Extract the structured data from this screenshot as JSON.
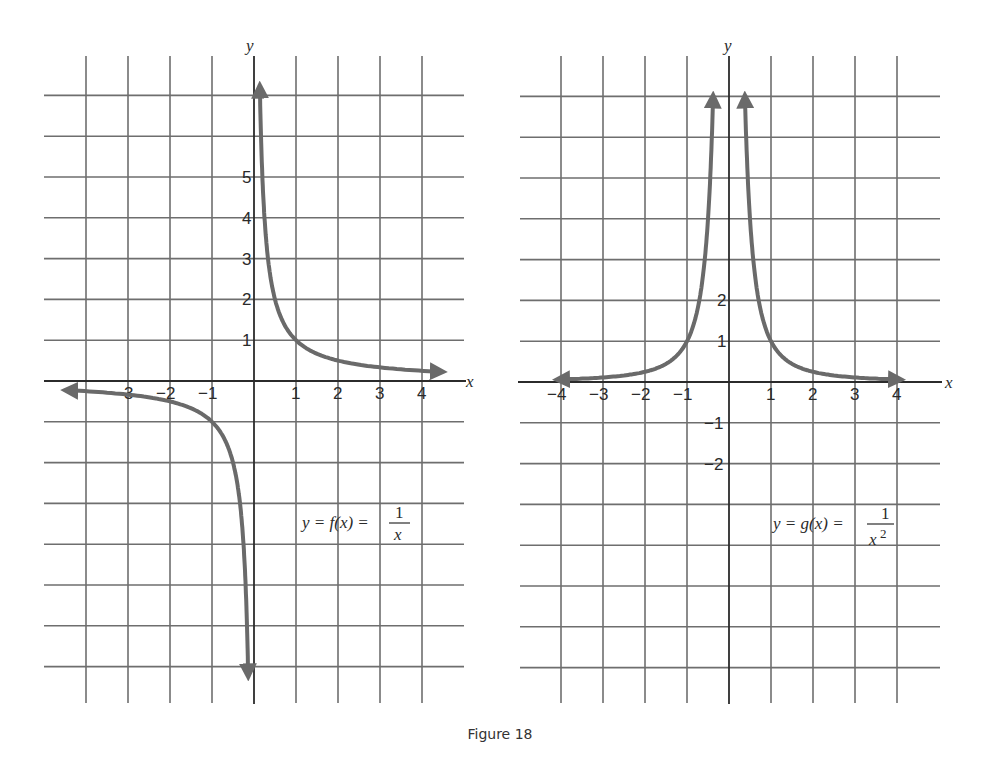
{
  "figure": {
    "caption": "Figure 18"
  },
  "panels": [
    {
      "id": "left",
      "equation": {
        "lhs": "y = f(x) = ",
        "numerator": "1",
        "denominator": "x",
        "exponent": ""
      },
      "x_axis_label": "x",
      "y_axis_label": "y",
      "x_tick_labels": [
        "−3",
        "−2",
        "−1",
        "1",
        "2",
        "3",
        "4"
      ],
      "y_tick_labels": [
        "5",
        "4",
        "3",
        "2",
        "1"
      ]
    },
    {
      "id": "right",
      "equation": {
        "lhs": "y = g(x) = ",
        "numerator": "1",
        "denominator": "x",
        "exponent": "2"
      },
      "x_axis_label": "x",
      "y_axis_label": "y",
      "x_tick_labels": [
        "−4",
        "−3",
        "−2",
        "−1",
        "1",
        "2",
        "3",
        "4"
      ],
      "y_tick_labels": [
        "2",
        "1",
        "−1",
        "−2"
      ]
    }
  ],
  "chart_data": [
    {
      "type": "line",
      "title": "y = f(x) = 1/x",
      "xlabel": "x",
      "ylabel": "y",
      "xlim": [
        -4,
        4
      ],
      "ylim": [
        -7,
        7
      ],
      "grid": true,
      "x_ticks": [
        -3,
        -2,
        -1,
        1,
        2,
        3,
        4
      ],
      "y_ticks": [
        1,
        2,
        3,
        4,
        5
      ],
      "series": [
        {
          "name": "f(x)=1/x (x>0)",
          "x": [
            0.14,
            0.2,
            0.25,
            0.33,
            0.5,
            1,
            2,
            3,
            4.4
          ],
          "y": [
            7,
            5,
            4,
            3,
            2,
            1,
            0.5,
            0.33,
            0.23
          ]
        },
        {
          "name": "f(x)=1/x (x<0)",
          "x": [
            -4.4,
            -3,
            -2,
            -1,
            -0.5,
            -0.33,
            -0.25,
            -0.2,
            -0.14
          ],
          "y": [
            -0.23,
            -0.33,
            -0.5,
            -1,
            -2,
            -3,
            -4,
            -5,
            -7
          ]
        }
      ],
      "annotations": [
        "arrows indicate curve continues: up along y-axis, right along x-axis, left along x-axis, down along y-axis"
      ]
    },
    {
      "type": "line",
      "title": "y = g(x) = 1/x^2",
      "xlabel": "x",
      "ylabel": "y",
      "xlim": [
        -4.5,
        4.5
      ],
      "ylim": [
        -7,
        7
      ],
      "grid": true,
      "x_ticks": [
        -4,
        -3,
        -2,
        -1,
        1,
        2,
        3,
        4
      ],
      "y_ticks": [
        -2,
        -1,
        1,
        2
      ],
      "series": [
        {
          "name": "g(x)=1/x^2 (x>0)",
          "x": [
            0.38,
            0.5,
            0.7,
            1,
            1.5,
            2,
            3,
            4
          ],
          "y": [
            7,
            4,
            2,
            1,
            0.44,
            0.25,
            0.11,
            0.06
          ]
        },
        {
          "name": "g(x)=1/x^2 (x<0)",
          "x": [
            -4,
            -3,
            -2,
            -1.5,
            -1,
            -0.7,
            -0.5,
            -0.38
          ],
          "y": [
            0.06,
            0.11,
            0.25,
            0.44,
            1,
            2,
            4,
            7
          ]
        }
      ],
      "annotations": [
        "arrows indicate both branches continue upward near the y-axis and flatten toward x-axis"
      ]
    }
  ]
}
